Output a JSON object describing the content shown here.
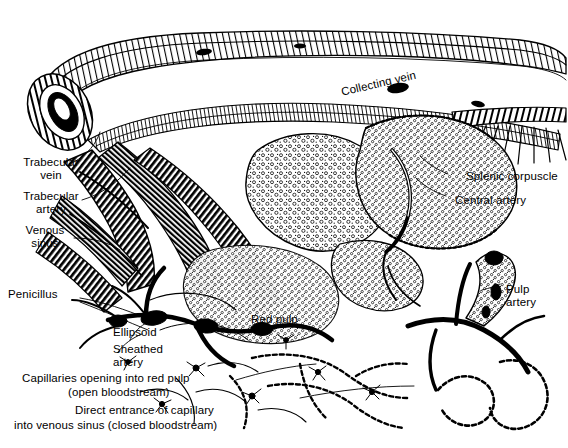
{
  "figure": {
    "background_color": "#ffffff",
    "ink_color": "#000000",
    "style": "black-and-white stippled and cross-hatched line drawing"
  },
  "labels": {
    "collecting_vein": "Collecting vein",
    "trabecular_vein": "Trabecular\nvein",
    "trabecular_artery": "Trabecular\nartery",
    "venous_sinus": "Venous\nsinus",
    "penicillus": "Penicillus",
    "ellipsoid": "Ellipsoid",
    "sheathed_artery": "Sheathed\nartery",
    "red_pulp": "Red pulp",
    "splenic_corpuscle": "Splenic corpuscle",
    "central_artery": "Central artery",
    "pulp_artery": "Pulp\nartery",
    "capillaries_open": "Capillaries opening into red pulp",
    "capillaries_open_sub": "(open bloodstream)",
    "direct_entrance": "Direct entrance of capillary",
    "direct_entrance_sub": "into venous sinus (closed bloodstream)"
  }
}
